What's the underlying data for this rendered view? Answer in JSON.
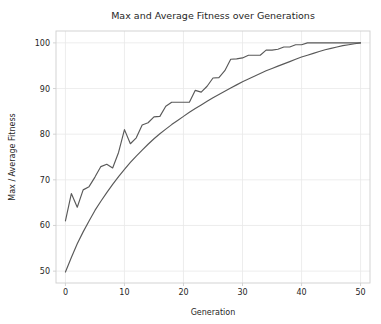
{
  "figure": {
    "width": 381,
    "height": 324,
    "background": "#ffffff"
  },
  "plot_area": {
    "left": 56,
    "right": 370,
    "top": 31,
    "bottom": 283,
    "spine_color": "#cfcfcf",
    "grid_color": "#e9e9e9"
  },
  "chart_data": {
    "type": "line",
    "title": "Max and Average Fitness over Generations",
    "xlabel": "Generation",
    "ylabel": "Max / Average Fitness",
    "xlim": [
      -1.6,
      51.6
    ],
    "ylim": [
      47.4,
      102.6
    ],
    "xticks": [
      0,
      10,
      20,
      30,
      40,
      50
    ],
    "xticklabels": [
      "0",
      "10",
      "20",
      "30",
      "40",
      "50"
    ],
    "yticks": [
      50,
      60,
      70,
      80,
      90,
      100
    ],
    "yticklabels": [
      "50",
      "60",
      "70",
      "80",
      "90",
      "100"
    ],
    "grid": true,
    "legend": null,
    "x": [
      0,
      1,
      2,
      3,
      4,
      5,
      6,
      7,
      8,
      9,
      10,
      11,
      12,
      13,
      14,
      15,
      16,
      17,
      18,
      19,
      20,
      21,
      22,
      23,
      24,
      25,
      26,
      27,
      28,
      29,
      30,
      31,
      32,
      33,
      34,
      35,
      36,
      37,
      38,
      39,
      40,
      41,
      42,
      43,
      44,
      45,
      46,
      47,
      48,
      49,
      50
    ],
    "series": [
      {
        "name": "Max Fitness",
        "color": "#595959",
        "linewidth": 1.15,
        "values": [
          61.0,
          67.0,
          64.0,
          67.8,
          68.5,
          70.6,
          72.9,
          73.4,
          72.6,
          76.0,
          81.0,
          77.9,
          79.2,
          82.0,
          82.5,
          83.8,
          83.9,
          86.1,
          87.0,
          87.0,
          87.0,
          87.0,
          89.6,
          89.2,
          90.5,
          92.3,
          92.4,
          93.9,
          96.4,
          96.5,
          96.7,
          97.3,
          97.3,
          97.3,
          98.4,
          98.4,
          98.6,
          99.1,
          99.1,
          99.6,
          99.6,
          100.0,
          100.0,
          100.0,
          100.0,
          100.0,
          100.0,
          100.0,
          100.0,
          100.0,
          100.0
        ]
      },
      {
        "name": "Average Fitness",
        "color": "#595959",
        "linewidth": 1.15,
        "values": [
          49.8,
          53.0,
          56.0,
          58.6,
          61.0,
          63.3,
          65.3,
          67.2,
          69.0,
          70.7,
          72.3,
          73.8,
          75.2,
          76.5,
          77.8,
          79.0,
          80.1,
          81.1,
          82.1,
          83.0,
          83.9,
          84.8,
          85.6,
          86.4,
          87.2,
          88.0,
          88.7,
          89.4,
          90.1,
          90.8,
          91.5,
          92.1,
          92.7,
          93.3,
          93.9,
          94.4,
          94.9,
          95.4,
          95.9,
          96.4,
          96.9,
          97.3,
          97.7,
          98.1,
          98.5,
          98.8,
          99.1,
          99.4,
          99.6,
          99.8,
          100.0
        ]
      }
    ]
  }
}
